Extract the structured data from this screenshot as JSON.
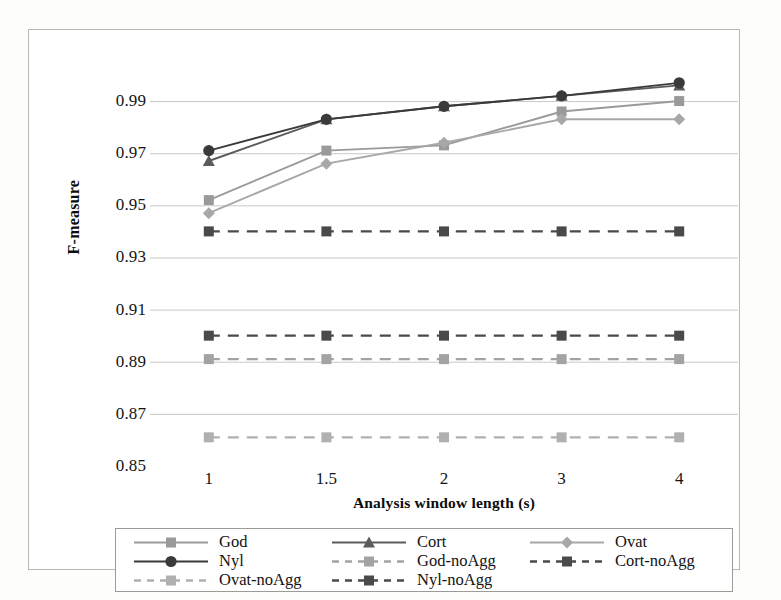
{
  "chart_data": {
    "type": "line",
    "title": "",
    "xlabel": "Analysis window length (s)",
    "ylabel": "F-measure",
    "categories": [
      "1",
      "1.5",
      "2",
      "3",
      "4"
    ],
    "ylim": [
      0.85,
      1.0
    ],
    "yticks": [
      "0.85",
      "0.87",
      "0.89",
      "0.91",
      "0.93",
      "0.95",
      "0.97",
      "0.99"
    ],
    "ytick_values": [
      0.85,
      0.87,
      0.89,
      0.91,
      0.93,
      0.95,
      0.97,
      0.99
    ],
    "grid": true,
    "legend_position": "bottom",
    "series": [
      {
        "name": "God",
        "values": [
          0.952,
          0.971,
          0.973,
          0.986,
          0.99
        ],
        "color": "#9a9a9a",
        "marker": "square",
        "dash": "solid"
      },
      {
        "name": "Cort",
        "values": [
          0.967,
          0.983,
          0.988,
          0.992,
          0.996
        ],
        "color": "#5c5c5c",
        "marker": "triangle",
        "dash": "solid"
      },
      {
        "name": "Ovat",
        "values": [
          0.947,
          0.966,
          0.974,
          0.983,
          0.983
        ],
        "color": "#a8a8a8",
        "marker": "diamond",
        "dash": "solid"
      },
      {
        "name": "Nyl",
        "values": [
          0.971,
          0.983,
          0.988,
          0.992,
          0.997
        ],
        "color": "#3a3a3a",
        "marker": "circle",
        "dash": "solid"
      },
      {
        "name": "God-noAgg",
        "values": [
          0.891,
          0.891,
          0.891,
          0.891,
          0.891
        ],
        "color": "#a3a3a3",
        "marker": "square",
        "dash": "dashed"
      },
      {
        "name": "Cort-noAgg",
        "values": [
          0.9,
          0.9,
          0.9,
          0.9,
          0.9
        ],
        "color": "#4a4a4a",
        "marker": "square",
        "dash": "dashed"
      },
      {
        "name": "Ovat-noAgg",
        "values": [
          0.861,
          0.861,
          0.861,
          0.861,
          0.861
        ],
        "color": "#b0b0b0",
        "marker": "square",
        "dash": "dashed"
      },
      {
        "name": "Nyl-noAgg",
        "values": [
          0.94,
          0.94,
          0.94,
          0.94,
          0.94
        ],
        "color": "#4a4a4a",
        "marker": "square",
        "dash": "dashed"
      }
    ]
  },
  "axes": {
    "y_title": "F-measure",
    "x_title": "Analysis window length (s)",
    "y_tick_labels": [
      "0.99",
      "0.97",
      "0.95",
      "0.93",
      "0.91",
      "0.89",
      "0.87",
      "0.85"
    ],
    "x_tick_labels": [
      "1",
      "1.5",
      "2",
      "3",
      "4"
    ]
  },
  "legend": {
    "entries": [
      {
        "label": "God"
      },
      {
        "label": "Cort"
      },
      {
        "label": "Ovat"
      },
      {
        "label": "Nyl"
      },
      {
        "label": "God-noAgg"
      },
      {
        "label": "Cort-noAgg"
      },
      {
        "label": "Ovat-noAgg"
      },
      {
        "label": "Nyl-noAgg"
      }
    ]
  },
  "colors": {
    "grid": "#c9c9c4",
    "frame": "#b9b9b4",
    "legend_border": "#9b9b96",
    "text": "#141414",
    "background": "#ffffff"
  }
}
